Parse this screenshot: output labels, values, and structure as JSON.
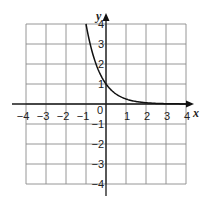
{
  "chart_data": {
    "type": "line",
    "title": "",
    "xlabel": "x",
    "ylabel": "y",
    "xlim": [
      -4,
      4
    ],
    "ylim": [
      -4,
      4
    ],
    "grid": true,
    "legend": null,
    "x_ticks": [
      "−4",
      "−3",
      "−2",
      "−1",
      "0",
      "1",
      "2",
      "3",
      "4"
    ],
    "y_ticks": [
      "4",
      "3",
      "2",
      "1",
      "−1",
      "−2",
      "−3",
      "−4"
    ],
    "series": [
      {
        "name": "f(x) = 4^(-x)",
        "x": [
          -1,
          -0.75,
          -0.5,
          -0.25,
          0,
          0.25,
          0.5,
          0.75,
          1,
          1.5,
          2,
          2.5,
          3
        ],
        "values": [
          4,
          2.83,
          2,
          1.41,
          1,
          0.71,
          0.5,
          0.35,
          0.25,
          0.125,
          0.06,
          0.03,
          0.02
        ]
      }
    ]
  }
}
